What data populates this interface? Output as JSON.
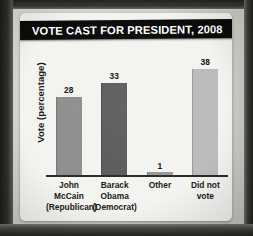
{
  "card": {
    "title": "VOTE CAST FOR PRESIDENT, 2008"
  },
  "chart_data": {
    "type": "bar",
    "title": "VOTE CAST FOR PRESIDENT, 2008",
    "xlabel": "",
    "ylabel": "Vote (percentage)",
    "ylim": [
      0,
      40
    ],
    "grid": false,
    "legend": "none",
    "categories": [
      "John McCain (Republican)",
      "Barack Obama (Democrat)",
      "Other",
      "Did not vote"
    ],
    "values": [
      28,
      33,
      1,
      38
    ],
    "bars": [
      {
        "label_lines": [
          "John",
          "McCain",
          "(Republican)"
        ],
        "value": 28,
        "value_text": "28",
        "color": "#8e8e8e"
      },
      {
        "label_lines": [
          "Barack",
          "Obama",
          "(Democrat)"
        ],
        "value": 33,
        "value_text": "33",
        "color": "#5b5b5b"
      },
      {
        "label_lines": [
          "Other"
        ],
        "value": 1,
        "value_text": "1",
        "color": "#9a9a9a"
      },
      {
        "label_lines": [
          "Did not",
          "vote"
        ],
        "value": 38,
        "value_text": "38",
        "color": "#bcbcbc"
      }
    ],
    "colors": {
      "card_background": "#f3f3ef",
      "title_banner": "#0b0b0b",
      "title_text": "#ffffff",
      "axis_line": "#2b2b2b",
      "label_text": "#1a1a1a"
    }
  }
}
